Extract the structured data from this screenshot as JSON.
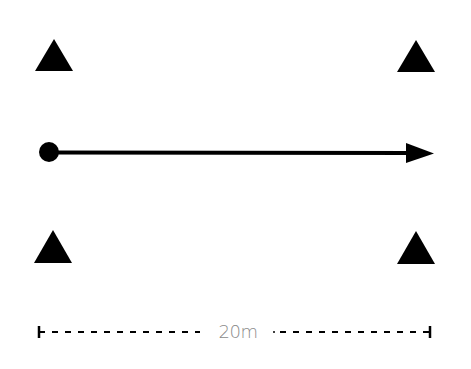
{
  "diagram": {
    "cones": [
      {
        "id": "top-left",
        "apex": [
          54,
          39
        ],
        "base_left": [
          35,
          71
        ],
        "base_right": [
          73,
          71
        ]
      },
      {
        "id": "top-right",
        "apex": [
          416,
          40
        ],
        "base_left": [
          397,
          72
        ],
        "base_right": [
          435,
          72
        ]
      },
      {
        "id": "bottom-left",
        "apex": [
          53,
          230
        ],
        "base_left": [
          34,
          263
        ],
        "base_right": [
          72,
          263
        ]
      },
      {
        "id": "bottom-right",
        "apex": [
          416,
          231
        ],
        "base_left": [
          397,
          264
        ],
        "base_right": [
          435,
          264
        ]
      }
    ],
    "start_marker": {
      "cx": 49,
      "cy": 152,
      "r": 10
    },
    "run_arrow": {
      "x1": 56,
      "y1": 152.5,
      "x2": 408,
      "y2": 153,
      "head": [
        [
          406,
          143
        ],
        [
          434,
          153.5
        ],
        [
          406,
          163
        ]
      ]
    },
    "distance": {
      "label": "20m",
      "y": 332,
      "left_cap_x": 39,
      "right_cap_x": 430,
      "left_dash_end": 200,
      "right_dash_start": 272
    },
    "colors": {
      "shapes": "#000000",
      "label": "#8a8a8a",
      "background": "#ffffff"
    }
  }
}
